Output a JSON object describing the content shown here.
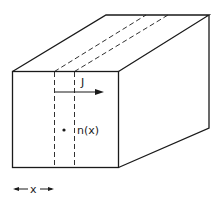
{
  "diagram": {
    "labels": {
      "current": "J",
      "density": "n(x)",
      "position": "x"
    },
    "colors": {
      "stroke": "#1a1a1a",
      "background": "#ffffff"
    }
  }
}
